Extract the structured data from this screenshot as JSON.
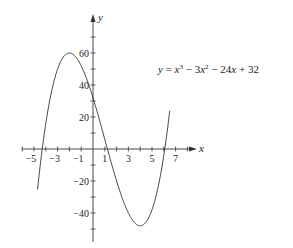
{
  "chart_data": {
    "type": "line",
    "title": "",
    "equation": "y = x³ − 3x² − 24x + 32",
    "xlabel": "x",
    "ylabel": "y",
    "xlim": [
      -5.5,
      8.5
    ],
    "ylim": [
      -55,
      80
    ],
    "x_ticks": [
      -5,
      -3,
      -1,
      1,
      3,
      5,
      7
    ],
    "y_ticks": [
      -40,
      -20,
      20,
      40,
      60
    ],
    "x_tick_labels": [
      "−5",
      "−3",
      "−1",
      "1",
      "3",
      "5",
      "7"
    ],
    "y_tick_labels": [
      "−40",
      "−20",
      "20",
      "40",
      "60"
    ],
    "grid": false,
    "series": [
      {
        "name": "y = x^3 - 3x^2 - 24x + 32",
        "coefficients": [
          1,
          -3,
          -24,
          32
        ],
        "x_range": [
          -4.7,
          6.5
        ],
        "x": [
          -4.7,
          -4,
          -3,
          -2,
          -1,
          0,
          1,
          2,
          3,
          4,
          5,
          6,
          6.5
        ],
        "values": [
          -47.6,
          16,
          50,
          60,
          52,
          32,
          6,
          -20,
          -40,
          -48,
          -38,
          -4,
          24.1
        ]
      }
    ]
  },
  "labels": {
    "x_axis": "x",
    "y_axis": "y",
    "equation": {
      "prefix": "y = x",
      "exp1": "3",
      "mid1": " − 3x",
      "exp2": "2",
      "rest": " − 24x + 32"
    }
  }
}
